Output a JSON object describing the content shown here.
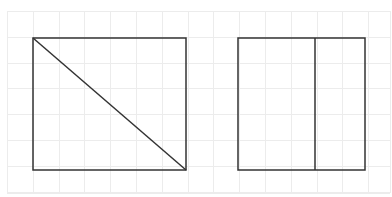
{
  "canvas": {
    "background": "#ffffff",
    "grid": {
      "color": "#ececec",
      "x0": 7,
      "y0": 11,
      "x1": 390,
      "y1": 193,
      "spacing": 25.8
    }
  },
  "shapes": [
    {
      "id": "rect-diagonal",
      "type": "rectangle",
      "x": 33,
      "y": 38,
      "width": 153,
      "height": 132,
      "stroke": "#333333",
      "stroke_width": 1.5,
      "divider": {
        "type": "diagonal",
        "from": "top-left",
        "to": "bottom-right"
      }
    },
    {
      "id": "rect-vertical-split",
      "type": "rectangle",
      "x": 238,
      "y": 38,
      "width": 127,
      "height": 132,
      "stroke": "#333333",
      "stroke_width": 1.5,
      "divider": {
        "type": "vertical",
        "x": 315
      }
    }
  ]
}
